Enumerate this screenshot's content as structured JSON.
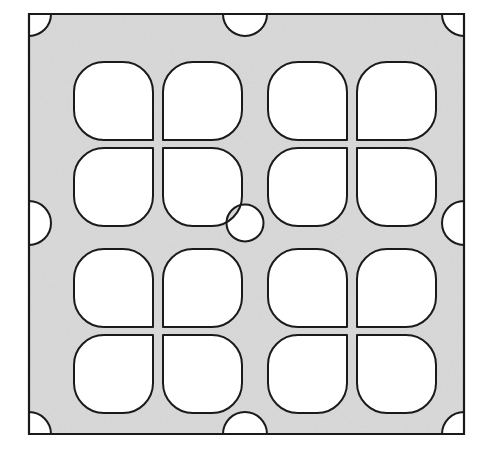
{
  "figure": {
    "name": "perforated-panel",
    "canvas": {
      "width": 486,
      "height": 450
    },
    "background_color": "#ffffff"
  },
  "panel": {
    "label": "panel-plate",
    "x": 29,
    "y": 14,
    "width": 435,
    "height": 420,
    "fill_color": "#d9d9d9",
    "stroke_color": "#1a1a1a",
    "stroke_width": 2.2,
    "texture": "speckled-gray"
  },
  "cutout_style": {
    "fill_color": "#ffffff",
    "stroke_color": "#1a1a1a",
    "stroke_width": 2.0,
    "corner_radius": 30
  },
  "grid": {
    "columns": 4,
    "rows": 4,
    "cluster_columns": 2,
    "cluster_rows": 2,
    "description": "Sixteen rounded-square cutouts grouped as four 2x2 clusters; each cutout keeps one sharp corner aimed at its cluster center."
  },
  "cutouts": [
    {
      "name": "cutout-r1-c1",
      "x": 74,
      "y": 62,
      "width": 79,
      "height": 78,
      "sharp_corner": "bottom-right"
    },
    {
      "name": "cutout-r1-c2",
      "x": 163,
      "y": 62,
      "width": 79,
      "height": 78,
      "sharp_corner": "bottom-left"
    },
    {
      "name": "cutout-r1-c3",
      "x": 268,
      "y": 62,
      "width": 79,
      "height": 78,
      "sharp_corner": "bottom-right"
    },
    {
      "name": "cutout-r1-c4",
      "x": 357,
      "y": 62,
      "width": 79,
      "height": 78,
      "sharp_corner": "bottom-left"
    },
    {
      "name": "cutout-r2-c1",
      "x": 74,
      "y": 148,
      "width": 79,
      "height": 78,
      "sharp_corner": "top-right"
    },
    {
      "name": "cutout-r2-c2",
      "x": 163,
      "y": 148,
      "width": 79,
      "height": 78,
      "sharp_corner": "top-left"
    },
    {
      "name": "cutout-r2-c3",
      "x": 268,
      "y": 148,
      "width": 79,
      "height": 78,
      "sharp_corner": "top-right"
    },
    {
      "name": "cutout-r2-c4",
      "x": 357,
      "y": 148,
      "width": 79,
      "height": 78,
      "sharp_corner": "top-left"
    },
    {
      "name": "cutout-r3-c1",
      "x": 74,
      "y": 249,
      "width": 79,
      "height": 78,
      "sharp_corner": "bottom-right"
    },
    {
      "name": "cutout-r3-c2",
      "x": 163,
      "y": 249,
      "width": 79,
      "height": 78,
      "sharp_corner": "bottom-left"
    },
    {
      "name": "cutout-r3-c3",
      "x": 268,
      "y": 249,
      "width": 79,
      "height": 78,
      "sharp_corner": "bottom-right"
    },
    {
      "name": "cutout-r3-c4",
      "x": 357,
      "y": 249,
      "width": 79,
      "height": 78,
      "sharp_corner": "bottom-left"
    },
    {
      "name": "cutout-r4-c1",
      "x": 74,
      "y": 335,
      "width": 79,
      "height": 78,
      "sharp_corner": "top-right"
    },
    {
      "name": "cutout-r4-c2",
      "x": 163,
      "y": 335,
      "width": 79,
      "height": 78,
      "sharp_corner": "top-left"
    },
    {
      "name": "cutout-r4-c3",
      "x": 268,
      "y": 335,
      "width": 79,
      "height": 78,
      "sharp_corner": "top-right"
    },
    {
      "name": "cutout-r4-c4",
      "x": 357,
      "y": 335,
      "width": 79,
      "height": 78,
      "sharp_corner": "top-left"
    }
  ],
  "center_hole": {
    "name": "center-circle-cutout",
    "cx": 245,
    "cy": 223,
    "r": 18.5,
    "shape": "circle"
  },
  "edge_notches": [
    {
      "name": "edge-notch-top",
      "edge": "top",
      "cx": 245,
      "cy": 14,
      "r": 22,
      "shape": "half-circle"
    },
    {
      "name": "edge-notch-bottom",
      "edge": "bottom",
      "cx": 245,
      "cy": 434,
      "r": 22,
      "shape": "half-circle"
    },
    {
      "name": "edge-notch-left",
      "edge": "left",
      "cx": 29,
      "cy": 223,
      "r": 22,
      "shape": "half-circle"
    },
    {
      "name": "edge-notch-right",
      "edge": "right",
      "cx": 464,
      "cy": 223,
      "r": 22,
      "shape": "half-circle"
    }
  ],
  "corner_notches": [
    {
      "name": "corner-notch-top-left",
      "corner": "top-left",
      "cx": 51,
      "cy": 36,
      "r": 22,
      "shape": "quarter-circle"
    },
    {
      "name": "corner-notch-top-right",
      "corner": "top-right",
      "cx": 442,
      "cy": 36,
      "r": 22,
      "shape": "quarter-circle"
    },
    {
      "name": "corner-notch-bottom-left",
      "corner": "bottom-left",
      "cx": 51,
      "cy": 412,
      "r": 22,
      "shape": "quarter-circle"
    },
    {
      "name": "corner-notch-bottom-right",
      "corner": "bottom-right",
      "cx": 442,
      "cy": 412,
      "r": 22,
      "shape": "quarter-circle"
    }
  ]
}
